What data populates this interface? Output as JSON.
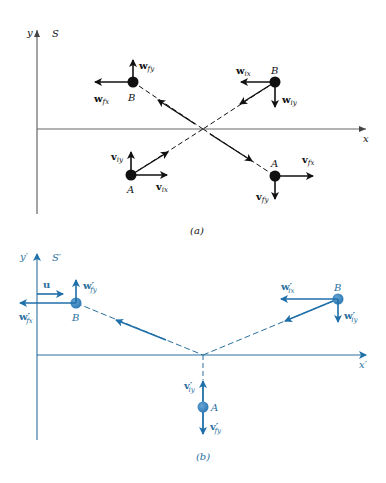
{
  "colors": {
    "black": "#111111",
    "axis_gray": "#666666",
    "blue": "#1f6fa8",
    "blue_light": "#4a90c4",
    "label_blue": "#2a6f9e"
  },
  "panel_a": {
    "caption": "(a)",
    "frame_label": "S",
    "y_axis_label": "y",
    "x_axis_label": "x",
    "particle_b": {
      "label": "B",
      "final_label": "B",
      "vectors": {
        "w_fy": {
          "main": "w",
          "sub": "fy"
        },
        "w_fx": {
          "main": "w",
          "sub": "fx"
        },
        "w_ix": {
          "main": "w",
          "sub": "ix"
        },
        "w_iy": {
          "main": "w",
          "sub": "iy"
        }
      }
    },
    "particle_a": {
      "label": "A",
      "final_label": "A",
      "vectors": {
        "v_iy": {
          "main": "v",
          "sub": "iy"
        },
        "v_ix": {
          "main": "v",
          "sub": "ix"
        },
        "v_fx": {
          "main": "v",
          "sub": "fx"
        },
        "v_fy": {
          "main": "v",
          "sub": "fy"
        }
      }
    }
  },
  "panel_b": {
    "caption": "(b)",
    "frame_label": "S′",
    "y_axis_label": "y′",
    "x_axis_label": "x′",
    "frame_velocity": "u",
    "particle_b": {
      "label": "B",
      "final_label": "B",
      "vectors": {
        "w_fy": {
          "main": "w′",
          "sub": "fy"
        },
        "w_fx": {
          "main": "w′",
          "sub": "fx"
        },
        "w_ix": {
          "main": "w′",
          "sub": "ix"
        },
        "w_iy": {
          "main": "w′",
          "sub": "iy"
        }
      }
    },
    "particle_a": {
      "label": "A",
      "vectors": {
        "v_iy": {
          "main": "v′",
          "sub": "iy"
        },
        "v_fy": {
          "main": "v′",
          "sub": "fy"
        }
      }
    }
  }
}
